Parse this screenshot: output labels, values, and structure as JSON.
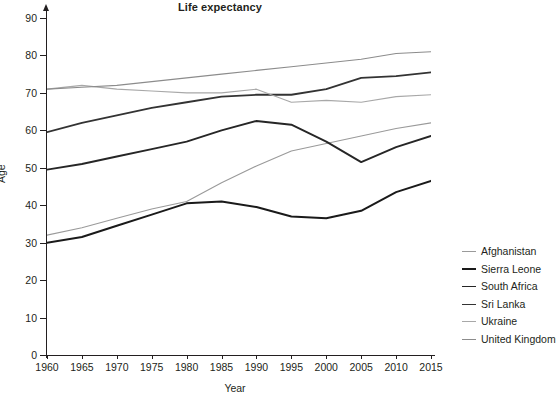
{
  "chart_data": {
    "type": "line",
    "title": "Life expectancy",
    "xlabel": "Year",
    "ylabel": "Age",
    "x": [
      1960,
      1965,
      1970,
      1975,
      1980,
      1985,
      1990,
      1995,
      2000,
      2005,
      2010,
      2015
    ],
    "xlim": [
      1960,
      2015
    ],
    "ylim": [
      0,
      90
    ],
    "yticks": [
      0,
      10,
      20,
      30,
      40,
      50,
      60,
      70,
      80,
      90
    ],
    "xticks": [
      1960,
      1965,
      1970,
      1975,
      1980,
      1985,
      1990,
      1995,
      2000,
      2005,
      2010,
      2015
    ],
    "grid": true,
    "grid_minor": true,
    "legend_position": "right",
    "series": [
      {
        "name": "Afghanistan",
        "color": "#9a9a9a",
        "width": 1.1,
        "values": [
          32.0,
          34.0,
          36.5,
          39.0,
          41.0,
          46.0,
          50.5,
          54.5,
          56.5,
          58.5,
          60.5,
          62.0
        ]
      },
      {
        "name": "Sierra Leone",
        "color": "#1a1a1a",
        "width": 2.0,
        "values": [
          30.0,
          31.5,
          34.5,
          37.5,
          40.5,
          41.0,
          39.5,
          37.0,
          36.5,
          38.5,
          43.5,
          46.5
        ]
      },
      {
        "name": "South Africa",
        "color": "#262626",
        "width": 1.9,
        "values": [
          49.5,
          51.0,
          53.0,
          55.0,
          57.0,
          60.0,
          62.5,
          61.5,
          57.0,
          51.5,
          55.5,
          58.5
        ]
      },
      {
        "name": "Sri Lanka",
        "color": "#333333",
        "width": 1.8,
        "values": [
          59.5,
          62.0,
          64.0,
          66.0,
          67.5,
          69.0,
          69.5,
          69.5,
          71.0,
          74.0,
          74.5,
          75.5
        ]
      },
      {
        "name": "Ukraine",
        "color": "#a8a8a8",
        "width": 1.1,
        "values": [
          71.0,
          72.0,
          71.0,
          70.5,
          70.0,
          70.0,
          71.0,
          67.5,
          68.0,
          67.5,
          69.0,
          69.5
        ]
      },
      {
        "name": "United Kingdom",
        "color": "#8c8c8c",
        "width": 1.1,
        "values": [
          71.0,
          71.5,
          72.0,
          73.0,
          74.0,
          75.0,
          76.0,
          77.0,
          78.0,
          79.0,
          80.5,
          81.0
        ]
      }
    ]
  }
}
